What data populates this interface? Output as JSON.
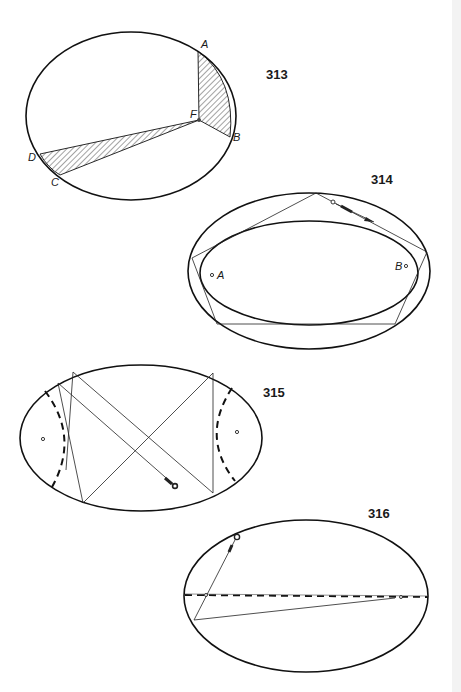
{
  "figures": [
    {
      "number": "313",
      "points": {
        "A": "A",
        "B": "B",
        "C": "C",
        "D": "D",
        "F": "F"
      },
      "description": "Ellipse with focus F; two hatched sectors FAB and FDC of equal area"
    },
    {
      "number": "314",
      "points": {
        "A": "A",
        "B": "B"
      },
      "description": "Confocal inner ellipse as caustic; billiard path tangent to inner ellipse with cue and ball"
    },
    {
      "number": "315",
      "points": {},
      "description": "Ellipse with dashed hyperbola caustic branches; billiard path crossing between foci"
    },
    {
      "number": "316",
      "points": {},
      "description": "Ellipse with dashed major axis; path through focus approaching the major axis"
    }
  ],
  "colors": {
    "ink": "#111111",
    "paper": "#ffffff",
    "hatch": "#333333"
  }
}
